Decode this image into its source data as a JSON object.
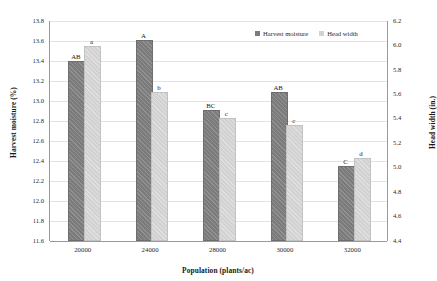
{
  "chart_data": {
    "type": "bar",
    "title": "",
    "xlabel": "Population (plants/ac)",
    "ylabel": "Harvest moisture (%)",
    "y2label": "Head width (in.)",
    "categories": [
      "20000",
      "24000",
      "28000",
      "30000",
      "32000"
    ],
    "ylim": [
      11.6,
      13.8
    ],
    "y2lim": [
      4.4,
      6.2
    ],
    "yticks": [
      "11.6",
      "11.8",
      "12.0",
      "12.2",
      "12.4",
      "12.6",
      "12.8",
      "13.0",
      "13.2",
      "13.4",
      "13.6",
      "13.8"
    ],
    "y2ticks": [
      "4.4",
      "4.6",
      "4.8",
      "5.0",
      "5.2",
      "5.4",
      "5.6",
      "5.8",
      "6.0",
      "6.2"
    ],
    "grid": true,
    "legend_position": "top-right",
    "series": [
      {
        "name": "Harvest moisture",
        "axis": "left",
        "color": "#7b7b7b",
        "values": [
          13.38,
          13.59,
          12.89,
          13.07,
          12.33
        ],
        "point_labels": [
          "AB",
          "A",
          "BC",
          "AB",
          "C"
        ]
      },
      {
        "name": "Head width",
        "axis": "right",
        "color": "#d2d2d2",
        "values": [
          5.98,
          5.6,
          5.39,
          5.33,
          5.06
        ],
        "point_labels": [
          "a",
          "b",
          "c",
          "c",
          "d"
        ]
      }
    ]
  },
  "legend": {
    "items": [
      {
        "label": "Harvest moisture"
      },
      {
        "label": "Head width"
      }
    ]
  }
}
